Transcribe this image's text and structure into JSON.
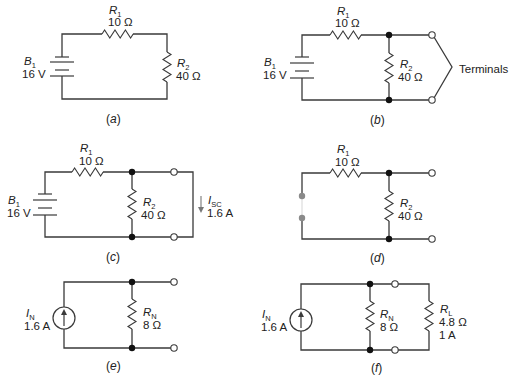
{
  "figure": {
    "panels": [
      {
        "id": "a",
        "caption_letter": "a",
        "battery": {
          "name": "B",
          "sub": "1",
          "value": "16 V"
        },
        "r1": {
          "name": "R",
          "sub": "1",
          "value": "10 Ω"
        },
        "r2": {
          "name": "R",
          "sub": "2",
          "value": "40 Ω"
        }
      },
      {
        "id": "b",
        "caption_letter": "b",
        "battery": {
          "name": "B",
          "sub": "1",
          "value": "16 V"
        },
        "r1": {
          "name": "R",
          "sub": "1",
          "value": "10 Ω"
        },
        "r2": {
          "name": "R",
          "sub": "2",
          "value": "40 Ω"
        },
        "terminals_label": "Terminals"
      },
      {
        "id": "c",
        "caption_letter": "c",
        "battery": {
          "name": "B",
          "sub": "1",
          "value": "16 V"
        },
        "r1": {
          "name": "R",
          "sub": "1",
          "value": "10 Ω"
        },
        "r2": {
          "name": "R",
          "sub": "2",
          "value": "40 Ω"
        },
        "isc": {
          "name": "I",
          "sub": "SC",
          "value": "1.6 A"
        }
      },
      {
        "id": "d",
        "caption_letter": "d",
        "r1": {
          "name": "R",
          "sub": "1",
          "value": "10 Ω"
        },
        "r2": {
          "name": "R",
          "sub": "2",
          "value": "40 Ω"
        }
      },
      {
        "id": "e",
        "caption_letter": "e",
        "source": {
          "name": "I",
          "sub": "N",
          "value": "1.6 A"
        },
        "rn": {
          "name": "R",
          "sub": "N",
          "value": "8 Ω"
        }
      },
      {
        "id": "f",
        "caption_letter": "f",
        "source": {
          "name": "I",
          "sub": "N",
          "value": "1.6 A"
        },
        "rn": {
          "name": "R",
          "sub": "N",
          "value": "8 Ω"
        },
        "rl": {
          "name": "R",
          "sub": "L",
          "value": "4.8 Ω",
          "current": "1 A"
        }
      }
    ]
  }
}
